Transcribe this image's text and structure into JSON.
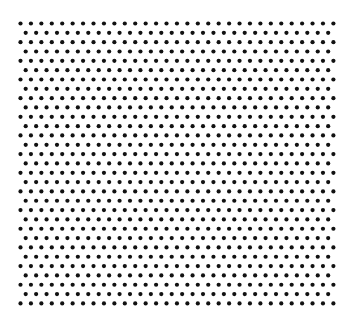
{
  "pattern": {
    "name": "hexagonal dot grid",
    "dot_color": "#111111",
    "background_color": "#ffffff",
    "dot_radius": 2.1,
    "rows": 31,
    "even_row_dots": 31,
    "odd_row_dots": 30,
    "origin_x": 20.5,
    "origin_y": 23.5,
    "odd_row_offset_x": 5.2,
    "col_spacing": 10.43,
    "row_spacing": 9.33
  }
}
